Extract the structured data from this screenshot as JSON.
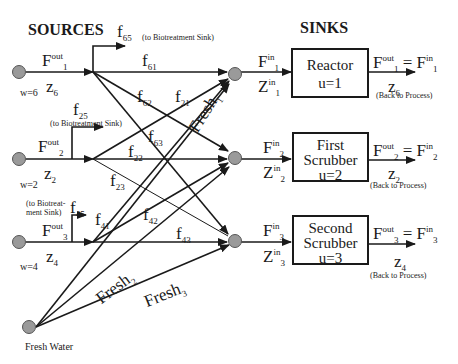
{
  "headers": {
    "sources": "SOURCES",
    "sinks": "SINKS"
  },
  "sources": [
    {
      "id": "source-1",
      "flow": "F",
      "flow_sup": "out",
      "flow_sub": "1",
      "z": "z",
      "z_sub": "6",
      "w": "w=6"
    },
    {
      "id": "source-2",
      "flow": "F",
      "flow_sup": "out",
      "flow_sub": "2",
      "z": "z",
      "z_sub": "2",
      "w": "w=2"
    },
    {
      "id": "source-3",
      "flow": "F",
      "flow_sup": "out",
      "flow_sub": "3",
      "z": "z",
      "z_sub": "4",
      "w": "w=4"
    }
  ],
  "fresh_water": {
    "label": "Fresh Water"
  },
  "biotreatment": [
    {
      "f": "f",
      "sub": "65",
      "note": "(to Biotreatment Sink)"
    },
    {
      "f": "f",
      "sub": "25",
      "note": "(to Biotreatment Sink)"
    },
    {
      "f": "f",
      "sub": "45",
      "note_line1": "(to Biotreat-",
      "note_line2": "ment  Sink)"
    }
  ],
  "flows": [
    {
      "f": "f",
      "sub": "61"
    },
    {
      "f": "f",
      "sub": "62"
    },
    {
      "f": "f",
      "sub": "21"
    },
    {
      "f": "f",
      "sub": "63"
    },
    {
      "f": "f",
      "sub": "22"
    },
    {
      "f": "f",
      "sub": "23"
    },
    {
      "f": "f",
      "sub": "41"
    },
    {
      "f": "f",
      "sub": "42"
    },
    {
      "f": "f",
      "sub": "43"
    }
  ],
  "fresh_flows": [
    {
      "label": "Fresh",
      "sub": "1"
    },
    {
      "label": "Fresh",
      "sub": "2"
    },
    {
      "label": "Fresh",
      "sub": "3"
    }
  ],
  "sinks": [
    {
      "id": "sink-1",
      "line1": "Reactor",
      "line2": "u=1",
      "in": "F",
      "in_sup": "in",
      "in_sub": "1",
      "zin": "Z",
      "zin_sup": "in",
      "zin_sub": "1",
      "out": "F",
      "out_sup": "out",
      "out_sub": "1",
      "eq": "= F",
      "eq_sup": "in",
      "eq_sub": "1",
      "z": "z",
      "z_sub": "6",
      "back": "(Back to Process)"
    },
    {
      "id": "sink-2",
      "line1": "First",
      "line2": "Scrubber",
      "line3": "u=2",
      "in": "F",
      "in_sup": "in",
      "in_sub": "2",
      "zin": "Z",
      "zin_sup": "in",
      "zin_sub": "2",
      "out": "F",
      "out_sup": "out",
      "out_sub": "2",
      "eq": "= F",
      "eq_sup": "in",
      "eq_sub": "2",
      "z": "z",
      "z_sub": "2",
      "back": "(Back to Process)"
    },
    {
      "id": "sink-3",
      "line1": "Second",
      "line2": "Scrubber",
      "line3": "u=3",
      "in": "F",
      "in_sup": "in",
      "in_sub": "3",
      "zin": "Z",
      "zin_sup": "in",
      "zin_sub": "3",
      "out": "F",
      "out_sup": "out",
      "out_sub": "3",
      "eq": "= F",
      "eq_sup": "in",
      "eq_sub": "3",
      "z": "z",
      "z_sub": "4",
      "back": "(Back to Process)"
    }
  ],
  "colors": {
    "node_fill": "#9a9a9a",
    "line": "#1a1a1a"
  }
}
